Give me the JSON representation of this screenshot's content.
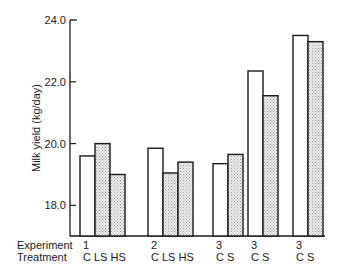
{
  "chart_data": {
    "type": "bar",
    "title": "",
    "xlabel": "",
    "ylabel": "Milk yield (kg/day)",
    "ylim": [
      17.0,
      24.0
    ],
    "yticks": [
      "24.0",
      "22.0",
      "20.0",
      "18.0"
    ],
    "grid": false,
    "legend": null,
    "row_labels": {
      "experiment": "Experiment",
      "treatment": "Treatment"
    },
    "groups": [
      {
        "experiment": "1",
        "treatments": [
          "C",
          "LS",
          "HS"
        ],
        "values": [
          19.6,
          20.0,
          19.0
        ],
        "shaded": [
          false,
          true,
          true
        ]
      },
      {
        "experiment": "2",
        "treatments": [
          "C",
          "LS",
          "HS"
        ],
        "values": [
          19.85,
          19.05,
          19.4
        ],
        "shaded": [
          false,
          true,
          true
        ]
      },
      {
        "experiment": "3",
        "treatments": [
          "C",
          "S"
        ],
        "values": [
          19.35,
          19.65
        ],
        "shaded": [
          false,
          true
        ]
      },
      {
        "experiment": "3",
        "treatments": [
          "C",
          "S"
        ],
        "values": [
          22.35,
          21.55
        ],
        "shaded": [
          false,
          true
        ]
      },
      {
        "experiment": "3",
        "treatments": [
          "C",
          "S"
        ],
        "values": [
          23.5,
          23.3
        ],
        "shaded": [
          false,
          true
        ]
      }
    ]
  }
}
